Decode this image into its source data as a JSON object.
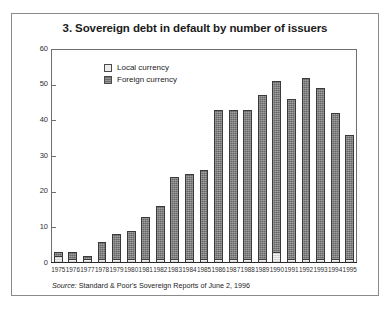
{
  "figure": {
    "title": "3. Sovereign debt in default by number of issuers",
    "source_word": "Source:",
    "source_text": "Standard & Poor's Sovereign Reports of June 2, 1996"
  },
  "legend": {
    "position": "inside-top-left",
    "entries": [
      {
        "label": "Local currency",
        "swatch": "light-gray-square",
        "color": "#ececec"
      },
      {
        "label": "Foreign currency",
        "swatch": "dark-gray-square",
        "color": "#7b7b7b"
      }
    ]
  },
  "axes": {
    "y_ticks": [
      60,
      50,
      40,
      30,
      20,
      10,
      0
    ],
    "y_min": 0,
    "y_max": 60
  },
  "chart_data": {
    "type": "bar",
    "stacked": true,
    "title": "3. Sovereign debt in default by number of issuers",
    "xlabel": "",
    "ylabel": "",
    "ylim": [
      0,
      60
    ],
    "ytick_step": 10,
    "grid": false,
    "legend_position": "inside-top-left",
    "categories": [
      "1975",
      "1976",
      "1977",
      "1978",
      "1979",
      "1980",
      "1981",
      "1982",
      "1983",
      "1984",
      "1985",
      "1986",
      "1987",
      "1988",
      "1989",
      "1990",
      "1991",
      "1992",
      "1993",
      "1994",
      "1995"
    ],
    "series": [
      {
        "name": "Local currency",
        "color": "#ececec",
        "values": [
          2,
          1,
          1,
          1,
          1,
          1,
          1,
          1,
          1,
          1,
          1,
          1,
          1,
          1,
          1,
          3,
          1,
          1,
          1,
          1,
          1
        ]
      },
      {
        "name": "Foreign currency",
        "color": "#7b7b7b",
        "values": [
          1,
          2,
          1,
          5,
          7,
          8,
          12,
          15,
          23,
          24,
          25,
          42,
          42,
          42,
          46,
          48,
          45,
          51,
          48,
          41,
          35
        ]
      }
    ],
    "totals": [
      3,
      3,
      2,
      6,
      8,
      9,
      13,
      16,
      24,
      25,
      26,
      43,
      43,
      43,
      47,
      51,
      46,
      52,
      49,
      42,
      36
    ],
    "source": "Source: Standard & Poor's Sovereign Reports of June 2, 1996"
  }
}
